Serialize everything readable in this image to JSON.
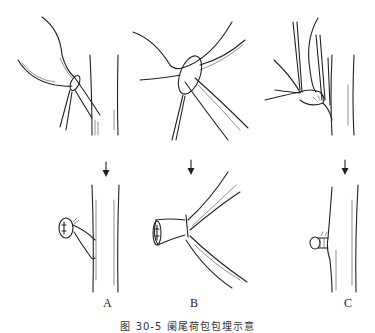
{
  "figure": {
    "caption": "图 30-5 阑尾荷包包埋示意",
    "panels": [
      {
        "id": "A",
        "label": "A"
      },
      {
        "id": "B",
        "label": "B"
      },
      {
        "id": "C",
        "label": "C"
      }
    ],
    "arrow_icon": "down-arrow-icon",
    "line_color": "#222222",
    "background": "#ffffff"
  }
}
